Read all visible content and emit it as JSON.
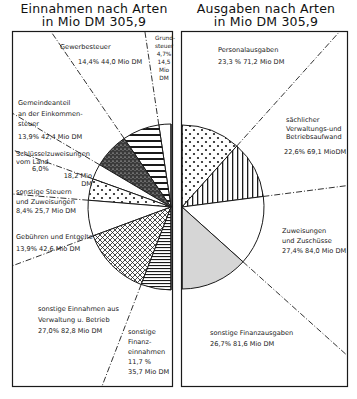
{
  "titles": {
    "left_line1": "Einnahmen nach Arten",
    "left_line2": "in Mio DM 305,9",
    "right_line1": "Ausgaben nach Arten",
    "right_line2": "in Mio DM 305,9"
  },
  "labels": {
    "grund": [
      "Grund-",
      "steuer",
      "4,7%",
      "14,5",
      "Mio",
      "DM"
    ],
    "gewerbe": [
      "Gewerbesteuer",
      "14,4%   44,0 Mio DM"
    ],
    "gemeinde": [
      "Gemeindeanteil",
      "an der Einkommen-",
      "steuer",
      "13,9%  42,4 Mio DM"
    ],
    "schluessel": [
      "Schlüsselzuweisungen",
      "vom Land",
      "6,0%",
      "18,2 Mio",
      "DM"
    ],
    "sonst_steuern": [
      "sonstige Steuern",
      "und Zuweisungen",
      "8,4%  25,7 Mio DM"
    ],
    "gebuehren": [
      "Gebühren und Entgelte",
      "13,9%   42,6 Mio DM"
    ],
    "sonst_einnahmen": [
      "sonstige Einnahmen aus",
      "Verwaltung u. Betrieb",
      "27,0%   82,8 Mio DM"
    ],
    "sonst_finanzein": [
      "sonstige",
      "Finanz-",
      "einnahmen",
      "11,7 %",
      "35,7 Mio DM"
    ],
    "personal": [
      "Personalausgaben",
      "23,3 %   71,2 Mio DM"
    ],
    "saechlich": [
      "sächlicher",
      "Verwaltungs-und",
      "Betriebsaufwand",
      "22,6%   69,1 MioDM"
    ],
    "zuweisungen": [
      "Zuweisungen",
      "und Zuschüsse",
      "27,4%  84,0 Mio DM"
    ],
    "sonst_finanzaus": [
      "sonstige  Finanzausgaben",
      "26,7%   81,6 Mio DM"
    ]
  },
  "chart_data": [
    {
      "type": "pie",
      "title": "Einnahmen nach Arten in Mio DM 305,9",
      "total": 305.9,
      "unit": "Mio DM",
      "layout": "half-pie (left semicircle), top to bottom counterclockwise",
      "categories": [
        "Grundsteuer",
        "Gewerbesteuer",
        "Gemeindeanteil an der Einkommensteuer",
        "Schlüsselzuweisungen vom Land",
        "sonstige Steuern und Zuweisungen",
        "Gebühren und Entgelte",
        "sonstige Einnahmen aus Verwaltung u. Betrieb",
        "sonstige Finanzeinnahmen"
      ],
      "percent": [
        4.7,
        14.4,
        13.9,
        6.0,
        8.4,
        13.9,
        27.0,
        11.7
      ],
      "values": [
        14.5,
        44.0,
        42.4,
        18.2,
        25.7,
        42.6,
        82.8,
        35.7
      ],
      "patterns": [
        "white",
        "horizontal-stripes",
        "dense-stipple",
        "white",
        "dots",
        "white",
        "crosshatch",
        "fine-horizontal"
      ]
    },
    {
      "type": "pie",
      "title": "Ausgaben nach Arten in Mio DM 305,9",
      "total": 305.9,
      "unit": "Mio DM",
      "layout": "half-pie (right semicircle), top to bottom clockwise",
      "categories": [
        "Personalausgaben",
        "sächlicher Verwaltungs- und Betriebsaufwand",
        "Zuweisungen und Zuschüsse",
        "sonstige Finanzausgaben"
      ],
      "percent": [
        23.3,
        22.6,
        27.4,
        26.7
      ],
      "values": [
        71.2,
        69.1,
        84.0,
        81.6
      ],
      "patterns": [
        "dots",
        "vertical-stripes",
        "white",
        "gray"
      ]
    }
  ],
  "colors": {
    "ink": "#1a1a1a",
    "gray_fill": "#d6d6d6",
    "paper": "#ffffff"
  }
}
